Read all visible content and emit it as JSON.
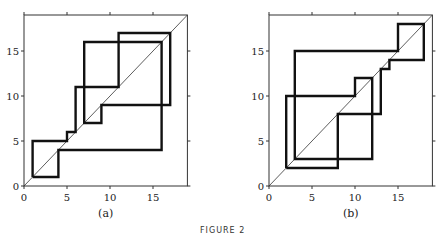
{
  "figure": {
    "caption": "FIGURE 2"
  },
  "chart_data": [
    {
      "type": "line",
      "title": "(a)",
      "panel_label": "(a)",
      "xlabel": "",
      "ylabel": "",
      "xlim": [
        0,
        19
      ],
      "ylim": [
        0,
        19
      ],
      "x_ticks": [
        0,
        5,
        10,
        15
      ],
      "y_ticks": [
        0,
        5,
        10,
        15
      ],
      "grid": false,
      "series": [
        {
          "name": "diagonal y=x",
          "points": [
            [
              0,
              0
            ],
            [
              19,
              19
            ]
          ]
        },
        {
          "name": "cobweb orbit",
          "points": [
            [
              1,
              1
            ],
            [
              1,
              5
            ],
            [
              5,
              5
            ],
            [
              5,
              6
            ],
            [
              6,
              6
            ],
            [
              6,
              11
            ],
            [
              11,
              11
            ],
            [
              11,
              17
            ],
            [
              17,
              17
            ],
            [
              17,
              9
            ],
            [
              9,
              9
            ],
            [
              9,
              7
            ],
            [
              7,
              7
            ],
            [
              7,
              16
            ],
            [
              16,
              16
            ],
            [
              16,
              4
            ],
            [
              4,
              4
            ],
            [
              4,
              1
            ],
            [
              1,
              1
            ]
          ]
        }
      ]
    },
    {
      "type": "line",
      "title": "(b)",
      "panel_label": "(b)",
      "xlabel": "",
      "ylabel": "",
      "xlim": [
        0,
        19
      ],
      "ylim": [
        0,
        19
      ],
      "x_ticks": [
        0,
        5,
        10,
        15
      ],
      "y_ticks": [
        0,
        5,
        10,
        15
      ],
      "grid": false,
      "series": [
        {
          "name": "diagonal y=x",
          "points": [
            [
              0,
              0
            ],
            [
              19,
              19
            ]
          ]
        },
        {
          "name": "cobweb orbit",
          "points": [
            [
              2,
              2
            ],
            [
              2,
              10
            ],
            [
              10,
              10
            ],
            [
              10,
              12
            ],
            [
              12,
              12
            ],
            [
              12,
              3
            ],
            [
              3,
              3
            ],
            [
              3,
              15
            ],
            [
              15,
              15
            ],
            [
              15,
              18
            ],
            [
              18,
              18
            ],
            [
              18,
              14
            ],
            [
              14,
              14
            ],
            [
              14,
              13
            ],
            [
              13,
              13
            ],
            [
              13,
              8
            ],
            [
              8,
              8
            ],
            [
              8,
              2
            ],
            [
              2,
              2
            ]
          ]
        }
      ]
    }
  ]
}
